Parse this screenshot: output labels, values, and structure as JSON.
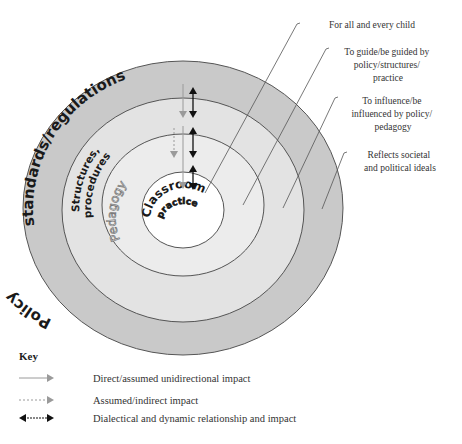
{
  "diagram": {
    "rings": [
      {
        "id": "policy",
        "label_part1": "Policy",
        "label_part2": "standards/regulations",
        "fill": "#c9c9c9"
      },
      {
        "id": "structures",
        "label_line1": "Structures,",
        "label_line2": "procedures",
        "fill": "#e3e3e3"
      },
      {
        "id": "pedagogy",
        "label": "Pedagogy",
        "fill": "#ececec"
      },
      {
        "id": "classroom",
        "label_line1": "Classroom",
        "label_line2": "practice",
        "fill": "#ffffff"
      }
    ],
    "annotations": [
      {
        "target": "classroom",
        "lines": [
          "For all and every child"
        ]
      },
      {
        "target": "pedagogy",
        "lines": [
          "To guide/be guided by",
          "policy/structures/",
          "practice"
        ]
      },
      {
        "target": "structures",
        "lines": [
          "To influence/be",
          "influenced by policy/",
          "pedagogy"
        ]
      },
      {
        "target": "policy",
        "lines": [
          "Reflects societal",
          "and political ideals"
        ]
      }
    ]
  },
  "key": {
    "title": "Key",
    "items": [
      {
        "type": "solid-gray-arrow",
        "label": "Direct/assumed unidirectional impact"
      },
      {
        "type": "dotted-gray-arrow",
        "label": "Assumed/indirect impact"
      },
      {
        "type": "black-double-arrow",
        "label": "Dialectical and dynamic relationship and impact"
      }
    ]
  },
  "colors": {
    "stroke": "#555555",
    "gray_arrow": "#9a9a9a",
    "black_arrow": "#111111",
    "pedagogy_text_outline": "#777777"
  }
}
